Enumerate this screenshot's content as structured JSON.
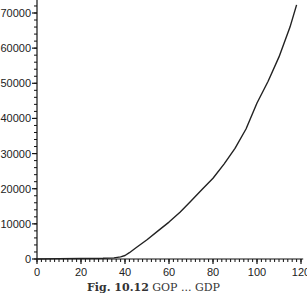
{
  "chart_data": {
    "type": "line",
    "title": "",
    "xlabel": "",
    "ylabel": "",
    "xlim": [
      0,
      122
    ],
    "ylim": [
      0,
      74000
    ],
    "grid": false,
    "legend": null,
    "x_ticks": [
      0,
      20,
      40,
      60,
      80,
      100,
      120
    ],
    "x_tick_labels": [
      "0",
      "20",
      "40",
      "60",
      "80",
      "100",
      "120"
    ],
    "x_minor_step": 2,
    "y_ticks": [
      0,
      10000,
      20000,
      30000,
      40000,
      50000,
      60000,
      70000
    ],
    "y_tick_labels": [
      "0",
      "10000",
      "20000",
      "30000",
      "40000",
      "50000",
      "60000",
      "70000"
    ],
    "y_minor_step": 2000,
    "series": [
      {
        "name": "curve",
        "color": "#222222",
        "x": [
          0,
          10,
          20,
          30,
          35,
          38,
          40,
          42,
          45,
          50,
          55,
          60,
          65,
          70,
          75,
          80,
          85,
          90,
          95,
          100,
          105,
          110,
          115,
          118
        ],
        "values": [
          0,
          100,
          150,
          200,
          300,
          600,
          1000,
          1800,
          3200,
          5500,
          8000,
          10500,
          13300,
          16500,
          19800,
          23000,
          27000,
          31500,
          37000,
          44400,
          50500,
          57500,
          66000,
          72300
        ]
      }
    ]
  },
  "caption": {
    "label": "Fig. 10.12",
    "text": "GOP ... GDP"
  }
}
